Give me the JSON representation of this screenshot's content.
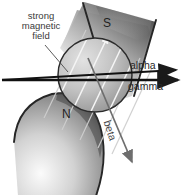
{
  "figure": {
    "background_color": "#ffffff",
    "width": 190,
    "height": 195
  },
  "labels": {
    "magnetic_field": "strong\nmagnetic\nfield",
    "alpha": "alpha",
    "gamma": "gamma",
    "beta": "beta",
    "pole_south": "S",
    "pole_north": "N"
  },
  "colors": {
    "text": "#2a2a2a",
    "ray_dark": "#1a1a1a",
    "ray_beta": "#6e6e6e",
    "field_line": "#f2f2f2",
    "field_line_outer": "#cfcfcf",
    "outline": "#262626",
    "magnet_light": "#f6f6f6",
    "magnet_mid": "#9a9a9a",
    "magnet_dark": "#3c3c3c",
    "sphere_light": "#d8d8d8",
    "sphere_dark": "#7c7c7c"
  },
  "rays": [
    {
      "name": "alpha",
      "label": "alpha",
      "deflection": "upward",
      "start": [
        2,
        80
      ],
      "end": [
        182,
        70
      ]
    },
    {
      "name": "gamma",
      "label": "gamma",
      "deflection": "undeflected",
      "start": [
        2,
        80
      ],
      "end": [
        183,
        80
      ]
    },
    {
      "name": "beta",
      "label": "beta",
      "deflection": "downward",
      "start": [
        88,
        58
      ],
      "end": [
        135,
        166
      ]
    }
  ],
  "magnet": {
    "south_pole": "S",
    "north_pole": "N",
    "field_direction": "lower-left to upper-right",
    "field_line_count": 5
  }
}
